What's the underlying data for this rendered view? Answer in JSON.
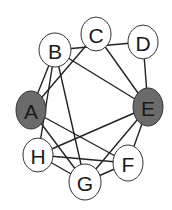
{
  "diagram": {
    "type": "graph",
    "colors": {
      "highlight_fill": "#6b6b6b",
      "default_fill": "#ffffff",
      "stroke": "#333333",
      "edge": "#222222"
    },
    "nodes": [
      {
        "id": "A",
        "label": "A",
        "x": 31,
        "y": 110,
        "rx": 15,
        "ry": 19,
        "highlighted": true
      },
      {
        "id": "B",
        "label": "B",
        "x": 55,
        "y": 50,
        "rx": 16,
        "ry": 17,
        "highlighted": false
      },
      {
        "id": "C",
        "label": "C",
        "x": 96,
        "y": 34,
        "rx": 15,
        "ry": 17,
        "highlighted": false
      },
      {
        "id": "D",
        "label": "D",
        "x": 143,
        "y": 42,
        "rx": 15,
        "ry": 17,
        "highlighted": false
      },
      {
        "id": "E",
        "label": "E",
        "x": 148,
        "y": 107,
        "rx": 15,
        "ry": 19,
        "highlighted": true
      },
      {
        "id": "F",
        "label": "F",
        "x": 128,
        "y": 163,
        "rx": 15,
        "ry": 18,
        "highlighted": false
      },
      {
        "id": "G",
        "label": "G",
        "x": 85,
        "y": 182,
        "rx": 16,
        "ry": 18,
        "highlighted": false
      },
      {
        "id": "H",
        "label": "H",
        "x": 38,
        "y": 155,
        "rx": 15,
        "ry": 17,
        "highlighted": false
      }
    ],
    "edges": [
      [
        "B",
        "D"
      ],
      [
        "B",
        "E"
      ],
      [
        "B",
        "A"
      ],
      [
        "B",
        "H"
      ],
      [
        "B",
        "G"
      ],
      [
        "C",
        "A"
      ],
      [
        "C",
        "E"
      ],
      [
        "D",
        "E"
      ],
      [
        "A",
        "G"
      ],
      [
        "A",
        "F"
      ],
      [
        "H",
        "E"
      ],
      [
        "H",
        "F"
      ],
      [
        "H",
        "G"
      ],
      [
        "E",
        "G"
      ],
      [
        "E",
        "F"
      ],
      [
        "G",
        "F"
      ]
    ]
  }
}
